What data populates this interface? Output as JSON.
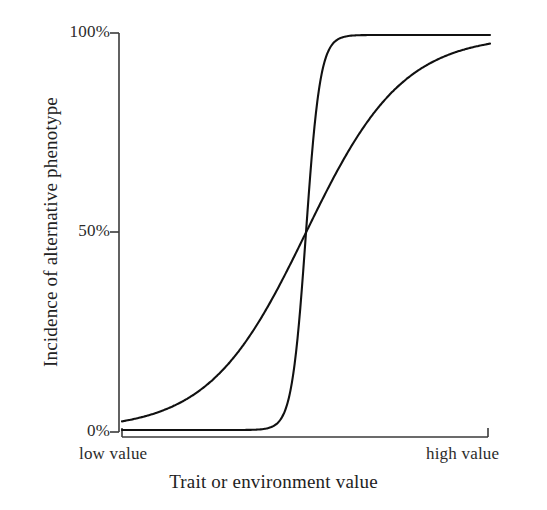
{
  "figure": {
    "background_color": "#ffffff",
    "line_color": "#111111",
    "axis_color": "#333333"
  },
  "axes": {
    "y_title": "Incidence of alternative phenotype",
    "x_title": "Trait or environment value",
    "y_ticks": [
      "100%",
      "50%",
      "0%"
    ],
    "x_ticks": [
      "low value",
      "high value"
    ]
  },
  "chart_data": {
    "type": "line",
    "title": "",
    "xlabel": "Trait or environment value",
    "ylabel": "Incidence of alternative phenotype",
    "xlim": [
      0,
      1
    ],
    "ylim": [
      0,
      100
    ],
    "grid": false,
    "legend": "none",
    "x_tick_labels": [
      "low value",
      "high value"
    ],
    "x_tick_values": [
      0,
      1
    ],
    "y_tick_labels": [
      "0%",
      "50%",
      "100%"
    ],
    "y_tick_values": [
      0,
      50,
      100
    ],
    "annotations": [],
    "x": [
      0,
      0.05,
      0.1,
      0.15,
      0.2,
      0.25,
      0.3,
      0.35,
      0.4,
      0.45,
      0.5,
      0.55,
      0.6,
      0.65,
      0.7,
      0.75,
      0.8,
      0.85,
      0.9,
      0.95,
      1
    ],
    "series": [
      {
        "name": "gradual response",
        "description": "shallow sigmoid, broad continuous reaction norm",
        "values": [
          1.5,
          2.5,
          4.0,
          6.0,
          9.0,
          13.0,
          18.0,
          24.5,
          32.0,
          41.0,
          50.0,
          59.5,
          68.5,
          76.5,
          83.0,
          88.0,
          91.8,
          94.6,
          96.6,
          98.0,
          99.0
        ]
      },
      {
        "name": "threshold response",
        "description": "steep sigmoid, abrupt switch-like polyphenism",
        "values": [
          0.1,
          0.1,
          0.1,
          0.2,
          0.2,
          0.3,
          0.4,
          0.6,
          1.2,
          6.0,
          50.0,
          93.5,
          98.7,
          99.5,
          99.8,
          99.9,
          100.0,
          100.0,
          100.0,
          100.0,
          100.0
        ]
      }
    ]
  }
}
